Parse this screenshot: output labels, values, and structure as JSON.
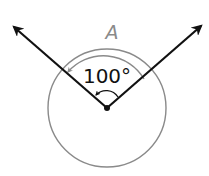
{
  "diagram": {
    "angle_label": "100°",
    "arc_label": "A",
    "colors": {
      "ray": "#111111",
      "circle": "#8a8a8a",
      "arc": "#8a8a8a",
      "label": "#111111",
      "arc_label": "#8a8a8a",
      "background": "#ffffff"
    }
  }
}
